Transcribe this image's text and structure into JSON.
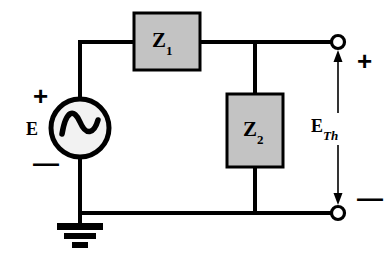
{
  "diagram": {
    "colors": {
      "wire": "#000000",
      "box_fill": "#c3c3c3",
      "box_stroke": "#000000",
      "source_fill": "#f2f2f2",
      "terminal_fill": "#ffffff",
      "background": "#ffffff"
    }
  },
  "source": {
    "name": "ac-voltage-source",
    "label": "E",
    "plus_sign": "+",
    "minus_sign": "—",
    "symbol": "sine-wave"
  },
  "impedance_1": {
    "symbol": "Z",
    "subscript": "1"
  },
  "impedance_2": {
    "symbol": "Z",
    "subscript": "2"
  },
  "output": {
    "label": "E",
    "subscript": "Th",
    "plus_sign": "+",
    "minus_sign": "—",
    "top_terminal": "open-terminal",
    "bottom_terminal": "open-terminal"
  },
  "ground": {
    "name": "earth-ground"
  }
}
